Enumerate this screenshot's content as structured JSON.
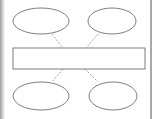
{
  "diagram": {
    "type": "hub-and-spoke",
    "center": {
      "shape": "rectangle",
      "label": ""
    },
    "nodes": [
      {
        "id": "top-left",
        "shape": "ellipse",
        "label": ""
      },
      {
        "id": "top-right",
        "shape": "ellipse",
        "label": ""
      },
      {
        "id": "bottom-left",
        "shape": "ellipse",
        "label": ""
      },
      {
        "id": "bottom-right",
        "shape": "ellipse",
        "label": ""
      }
    ],
    "connectors": {
      "style": "dashed",
      "color": "#8a8a8a"
    },
    "stroke_color": "#6e6e6e"
  }
}
